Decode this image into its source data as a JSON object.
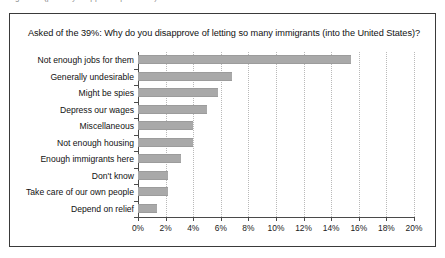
{
  "figure": {
    "top_caption_fragment": "Figure ... (partially cropped caption line)",
    "title": "Asked of the 39%: Why do you disapprove of letting so many immigrants (into the United States)?"
  },
  "chart_data": {
    "type": "bar",
    "orientation": "horizontal",
    "title": "Asked of the 39%: Why do you disapprove of letting so many immigrants (into the United States)?",
    "xlabel": "",
    "ylabel": "",
    "xlim": [
      0,
      20
    ],
    "xtick_labels": [
      "0%",
      "2%",
      "4%",
      "6%",
      "8%",
      "10%",
      "12%",
      "14%",
      "16%",
      "18%",
      "20%"
    ],
    "xtick_values": [
      0,
      2,
      4,
      6,
      8,
      10,
      12,
      14,
      16,
      18,
      20
    ],
    "grid": true,
    "grid_axis": "x",
    "legend": false,
    "bar_color": "#a9a9a9",
    "categories": [
      "Not enough jobs for them",
      "Generally undesirable",
      "Might be spies",
      "Depress our wages",
      "Miscellaneous",
      "Not enough housing",
      "Enough immigrants here",
      "Don't know",
      "Take care of our own people",
      "Depend on relief"
    ],
    "values": [
      15.4,
      6.8,
      5.8,
      5.0,
      4.0,
      4.0,
      3.1,
      2.2,
      2.2,
      1.4
    ],
    "units": "percent"
  }
}
